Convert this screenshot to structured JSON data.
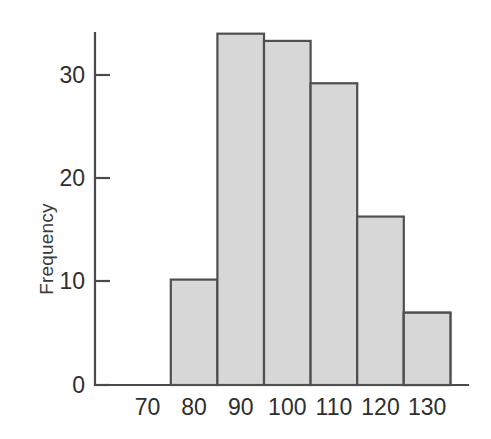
{
  "chart_data": {
    "type": "bar",
    "title": "",
    "subtitle": "",
    "xlabel": "",
    "ylabel": "Frequency",
    "categories": [
      "70",
      "80",
      "90",
      "100",
      "110",
      "120",
      "130"
    ],
    "values": [
      3.4,
      10.2,
      34.0,
      33.3,
      29.2,
      16.3,
      7.0
    ],
    "series": [
      {
        "name": "Frequency",
        "values": [
          3.4,
          10.2,
          34.0,
          33.3,
          29.2,
          16.3,
          7.0
        ]
      }
    ],
    "xtick_labels": [
      "70",
      "80",
      "90",
      "100",
      "110",
      "120",
      "130"
    ],
    "ytick_labels": [
      "0",
      "10",
      "20",
      "30"
    ],
    "ytick_values": [
      0,
      10,
      20,
      30
    ],
    "ylim": [
      0,
      35
    ],
    "grid": false,
    "legend": false,
    "legend_position": "none",
    "bar_fill_color": "#d7d7d7",
    "bar_edge_color": "#4f4f4f",
    "axis_color": "#4a4a4a",
    "text_color": "#2e2e2e",
    "background_color": "#ffffff",
    "annotations": []
  },
  "axes": {
    "y_axis_label": "Frequency",
    "y_ticks": [
      {
        "label": "0",
        "value": 0
      },
      {
        "label": "10",
        "value": 10
      },
      {
        "label": "20",
        "value": 20
      },
      {
        "label": "30",
        "value": 30
      }
    ],
    "x_ticks": [
      {
        "label": "70"
      },
      {
        "label": "80"
      },
      {
        "label": "90"
      },
      {
        "label": "100"
      },
      {
        "label": "110"
      },
      {
        "label": "120"
      },
      {
        "label": "130"
      }
    ]
  }
}
